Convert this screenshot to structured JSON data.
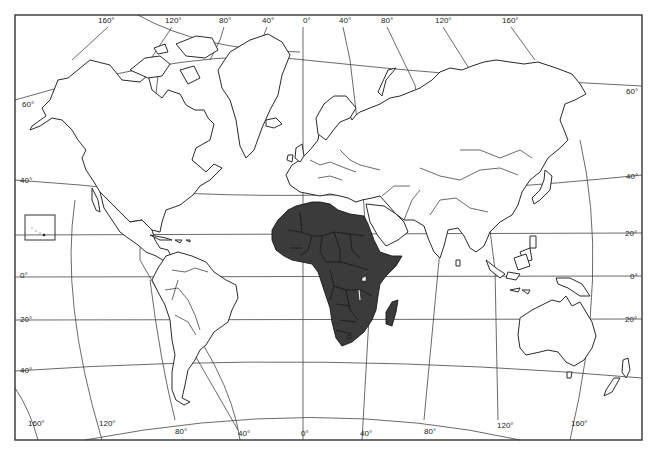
{
  "map": {
    "title": "",
    "projection": "world outline map",
    "highlight": {
      "region": "Africa",
      "fill_color": "#3b3b3b"
    },
    "colors": {
      "land": "#ffffff",
      "outline": "#2a2a2a",
      "background": "#ffffff",
      "highlight": "#3b3b3b"
    },
    "frame": {
      "x": 15,
      "y": 15,
      "width": 627,
      "height": 425
    },
    "top_longitude_labels": [
      {
        "text": "160°",
        "x": 98,
        "y": 21
      },
      {
        "text": "120°",
        "x": 165,
        "y": 21
      },
      {
        "text": "80°",
        "x": 219,
        "y": 21
      },
      {
        "text": "40°",
        "x": 262,
        "y": 21
      },
      {
        "text": "0°",
        "x": 303,
        "y": 21
      },
      {
        "text": "40°",
        "x": 339,
        "y": 21
      },
      {
        "text": "80°",
        "x": 381,
        "y": 21
      },
      {
        "text": "120°",
        "x": 435,
        "y": 21
      },
      {
        "text": "160°",
        "x": 502,
        "y": 21
      }
    ],
    "bottom_longitude_labels": [
      {
        "text": "160°",
        "x": 28,
        "y": 420
      },
      {
        "text": "120°",
        "x": 99,
        "y": 420
      },
      {
        "text": "80°",
        "x": 175,
        "y": 427
      },
      {
        "text": "40°",
        "x": 238,
        "y": 429
      },
      {
        "text": "0°",
        "x": 301,
        "y": 430
      },
      {
        "text": "40°",
        "x": 360,
        "y": 429
      },
      {
        "text": "80°",
        "x": 424,
        "y": 427
      },
      {
        "text": "120°",
        "x": 497,
        "y": 420
      },
      {
        "text": "160°",
        "x": 571,
        "y": 420
      }
    ],
    "left_latitude_labels": [
      {
        "text": "60°",
        "x": 22,
        "y": 101
      },
      {
        "text": "40°",
        "x": 20,
        "y": 180
      },
      {
        "text": "0°",
        "x": 20,
        "y": 275
      },
      {
        "text": "20°",
        "x": 20,
        "y": 318
      },
      {
        "text": "40°",
        "x": 20,
        "y": 371
      }
    ],
    "right_latitude_labels": [
      {
        "text": "60°",
        "x": 627,
        "y": 92
      },
      {
        "text": "40°",
        "x": 627,
        "y": 176
      },
      {
        "text": "20°",
        "x": 625,
        "y": 233
      },
      {
        "text": "0°",
        "x": 630,
        "y": 276
      },
      {
        "text": "20°",
        "x": 625,
        "y": 319
      }
    ]
  }
}
